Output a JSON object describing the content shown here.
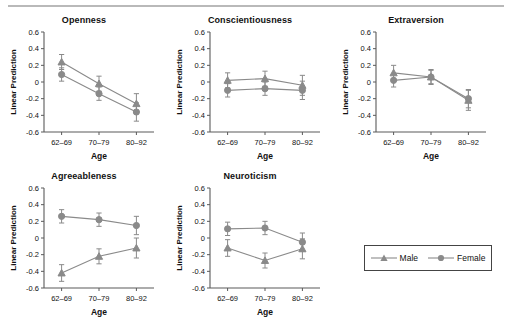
{
  "figure": {
    "legend": {
      "entries": [
        {
          "label": "Male",
          "marker": "triangle",
          "color": "#8a8a8a"
        },
        {
          "label": "Female",
          "marker": "circle",
          "color": "#8a8a8a"
        }
      ]
    }
  },
  "chart_data": [
    {
      "type": "line",
      "title": "Openness",
      "xlabel": "Age",
      "ylabel": "Linear Prediction",
      "categories": [
        "62–69",
        "70–79",
        "80–92"
      ],
      "ylim": [
        -0.6,
        0.6
      ],
      "yticks": [
        -0.6,
        -0.4,
        -0.2,
        0.0,
        0.2,
        0.4,
        0.6
      ],
      "grid": false,
      "series": [
        {
          "name": "Male",
          "values": [
            0.24,
            -0.02,
            -0.26
          ],
          "errors": [
            0.09,
            0.09,
            0.12
          ]
        },
        {
          "name": "Female",
          "values": [
            0.09,
            -0.14,
            -0.36
          ],
          "errors": [
            0.08,
            0.08,
            0.11
          ]
        }
      ]
    },
    {
      "type": "line",
      "title": "Conscientiousness",
      "xlabel": "Age",
      "ylabel": "Linear Prediction",
      "categories": [
        "62–69",
        "70–79",
        "80–92"
      ],
      "ylim": [
        -0.6,
        0.6
      ],
      "yticks": [
        -0.6,
        -0.4,
        -0.2,
        0.0,
        0.2,
        0.4,
        0.6
      ],
      "grid": false,
      "series": [
        {
          "name": "Male",
          "values": [
            0.02,
            0.04,
            -0.04
          ],
          "errors": [
            0.09,
            0.09,
            0.12
          ]
        },
        {
          "name": "Female",
          "values": [
            -0.1,
            -0.08,
            -0.1
          ],
          "errors": [
            0.08,
            0.08,
            0.11
          ]
        }
      ]
    },
    {
      "type": "line",
      "title": "Extraversion",
      "xlabel": "Age",
      "ylabel": "Linear Prediction",
      "categories": [
        "62–69",
        "70–79",
        "80–92"
      ],
      "ylim": [
        -0.6,
        0.6
      ],
      "yticks": [
        -0.6,
        -0.4,
        -0.2,
        0.0,
        0.2,
        0.4,
        0.6
      ],
      "grid": false,
      "series": [
        {
          "name": "Male",
          "values": [
            0.11,
            0.06,
            -0.22
          ],
          "errors": [
            0.09,
            0.09,
            0.12
          ]
        },
        {
          "name": "Female",
          "values": [
            0.02,
            0.06,
            -0.2
          ],
          "errors": [
            0.08,
            0.08,
            0.11
          ]
        }
      ]
    },
    {
      "type": "line",
      "title": "Agreeableness",
      "xlabel": "Age",
      "ylabel": "Linear Prediction",
      "categories": [
        "62–69",
        "70–79",
        "80–92"
      ],
      "ylim": [
        -0.6,
        0.6
      ],
      "yticks": [
        -0.6,
        -0.4,
        -0.2,
        0.0,
        0.2,
        0.4,
        0.6
      ],
      "grid": false,
      "series": [
        {
          "name": "Male",
          "values": [
            -0.42,
            -0.22,
            -0.12
          ],
          "errors": [
            0.1,
            0.09,
            0.12
          ]
        },
        {
          "name": "Female",
          "values": [
            0.26,
            0.22,
            0.15
          ],
          "errors": [
            0.08,
            0.08,
            0.11
          ]
        }
      ]
    },
    {
      "type": "line",
      "title": "Neuroticism",
      "xlabel": "Age",
      "ylabel": "Linear Prediction",
      "categories": [
        "62–69",
        "70–79",
        "80–92"
      ],
      "ylim": [
        -0.6,
        0.6
      ],
      "yticks": [
        -0.6,
        -0.4,
        -0.2,
        0.0,
        0.2,
        0.4,
        0.6
      ],
      "grid": false,
      "series": [
        {
          "name": "Male",
          "values": [
            -0.12,
            -0.27,
            -0.13
          ],
          "errors": [
            0.1,
            0.09,
            0.12
          ]
        },
        {
          "name": "Female",
          "values": [
            0.11,
            0.12,
            -0.05
          ],
          "errors": [
            0.08,
            0.08,
            0.11
          ]
        }
      ]
    }
  ]
}
